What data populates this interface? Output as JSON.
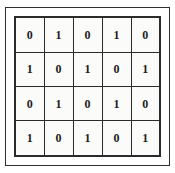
{
  "figure": {
    "name": "binary-matrix",
    "rows": 4,
    "columns": 5,
    "frame_color": "#2f2f2f",
    "grid_line_color": "#2b2b2b",
    "cell_background": "#fbfbfa",
    "text_color": "#1d1d1d",
    "page_background": "#ffffff"
  },
  "chart_data": {
    "type": "table",
    "title": "",
    "xlabel": "",
    "ylabel": "",
    "columns": [
      "c1",
      "c2",
      "c3",
      "c4",
      "c5"
    ],
    "rows": [
      [
        "0",
        "1",
        "0",
        "1",
        "0"
      ],
      [
        "1",
        "0",
        "1",
        "0",
        "1"
      ],
      [
        "0",
        "1",
        "0",
        "1",
        "0"
      ],
      [
        "1",
        "0",
        "1",
        "0",
        "1"
      ]
    ]
  }
}
